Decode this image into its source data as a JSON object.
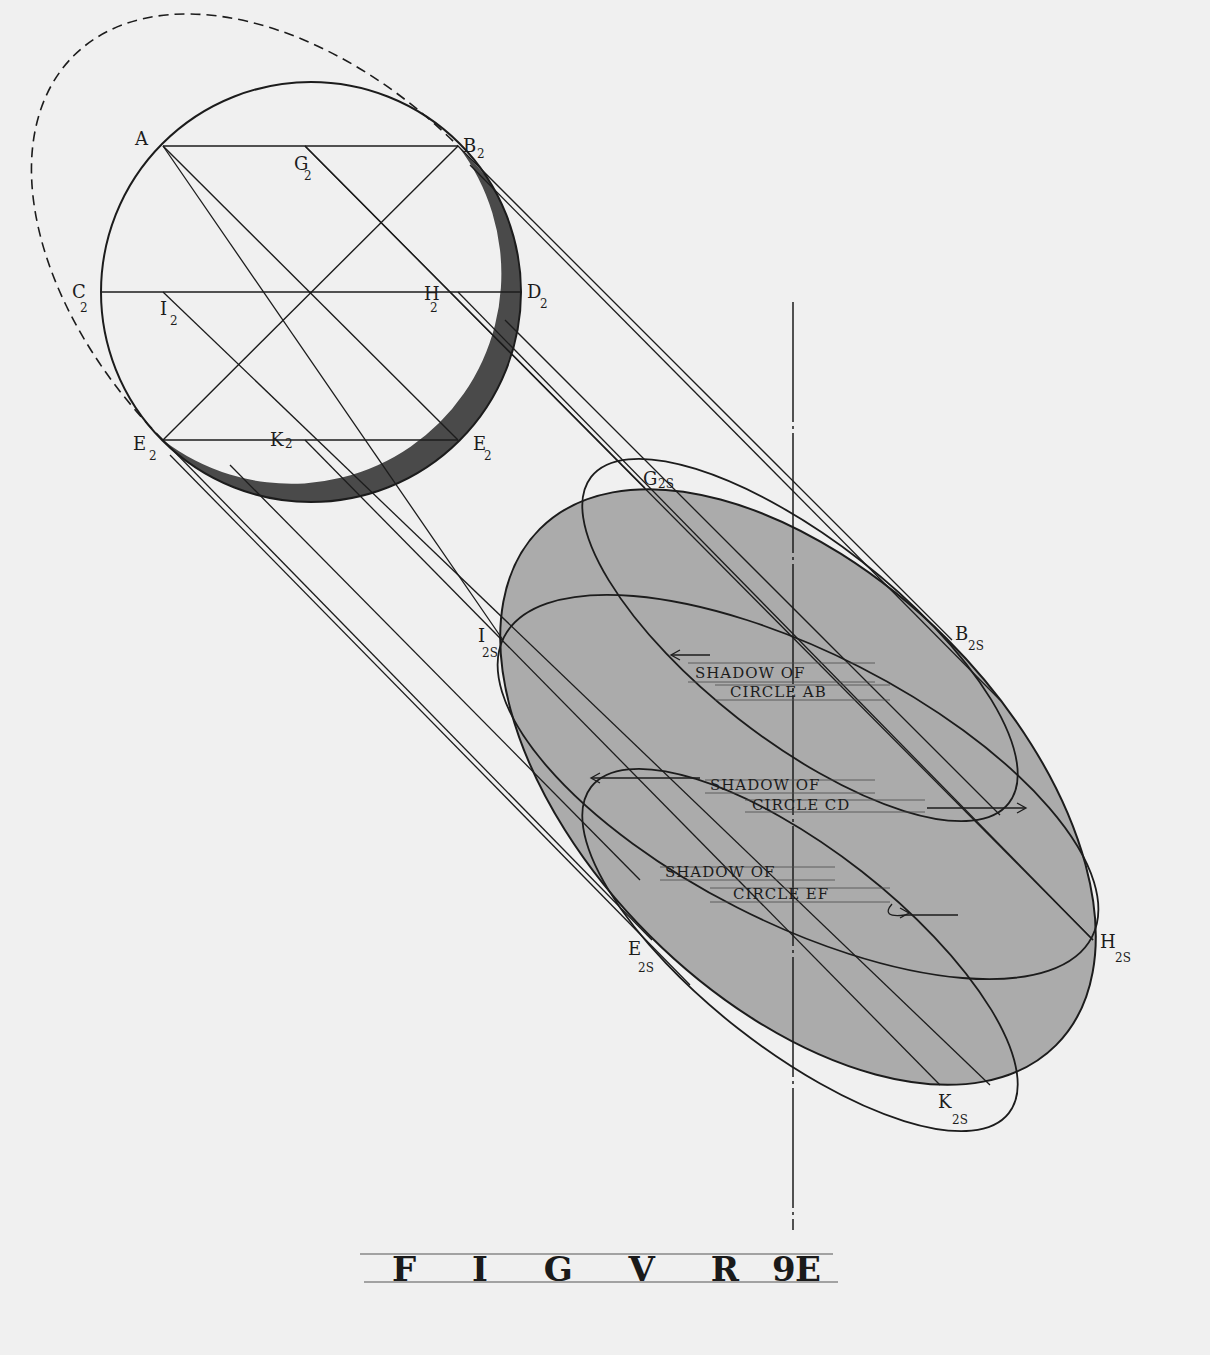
{
  "figure": {
    "caption": "FIGVRE 9",
    "caption_word": "F I G V R E",
    "caption_number": "9"
  },
  "sphere_labels": {
    "A": "A",
    "B": "B",
    "G": "G",
    "C": "C",
    "D": "D",
    "I": "I",
    "H": "H",
    "E_left": "E",
    "K": "K",
    "E_right": "E",
    "sub": "2"
  },
  "shadow_labels": {
    "G": "G",
    "B": "B",
    "I": "I",
    "H": "H",
    "E": "E",
    "K": "K",
    "sub": "2S"
  },
  "annotations": {
    "shadow_ab_line1": "SHADOW OF",
    "shadow_ab_line2": "CIRCLE AB",
    "shadow_cd_line1": "SHADOW OF",
    "shadow_cd_line2": "CIRCLE  CD",
    "shadow_ef_line1": "SHADOW OF",
    "shadow_ef_line2": "CIRCLE EF"
  },
  "colors": {
    "paper": "#f0f0f0",
    "ink": "#1c1c1c",
    "shadow_fill": "#a9a9a9",
    "sphere_shade": "#4a4a4a"
  }
}
